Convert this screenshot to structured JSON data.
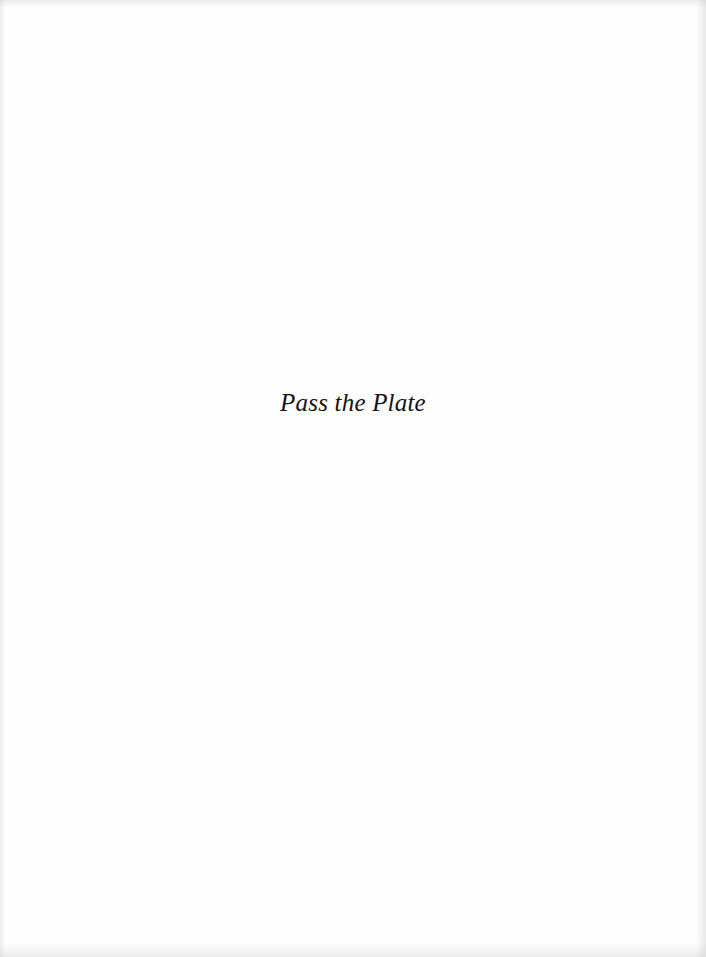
{
  "page": {
    "type": "half-title",
    "title": "Pass the Plate",
    "background_color": "#fefefe",
    "text_color": "#141414"
  }
}
